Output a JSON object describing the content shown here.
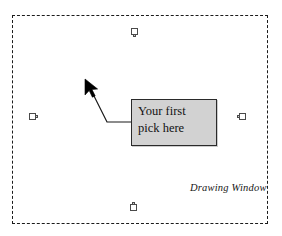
{
  "canvas": {
    "width": 282,
    "height": 236,
    "background_color": "#ffffff"
  },
  "drawing_window": {
    "caption": "Drawing Window",
    "border_style": "dashed",
    "border_color": "#1b1b1b",
    "bounds": {
      "x": 12,
      "y": 15,
      "width": 256,
      "height": 209
    }
  },
  "grips": [
    {
      "name": "grip-top",
      "position": "top",
      "x": 131,
      "y": 28
    },
    {
      "name": "grip-right",
      "position": "right",
      "x": 239,
      "y": 113
    },
    {
      "name": "grip-bottom",
      "position": "bottom",
      "x": 130,
      "y": 204
    },
    {
      "name": "grip-left",
      "position": "left",
      "x": 29,
      "y": 113
    }
  ],
  "callout": {
    "text": "Your first\npick here",
    "line1": "Your first",
    "line2": "pick here",
    "fill_color": "#d2d2d2",
    "border_color": "#2a2a2a",
    "bounds": {
      "x": 131,
      "y": 99,
      "width": 86,
      "height": 47
    }
  },
  "leader": {
    "color": "#1a1a1a",
    "points": [
      {
        "x": 89,
        "y": 86
      },
      {
        "x": 107,
        "y": 122
      },
      {
        "x": 131,
        "y": 122
      }
    ]
  },
  "cursor": {
    "icon": "arrow-pointer-icon",
    "x": 85,
    "y": 80,
    "color": "#000000"
  }
}
